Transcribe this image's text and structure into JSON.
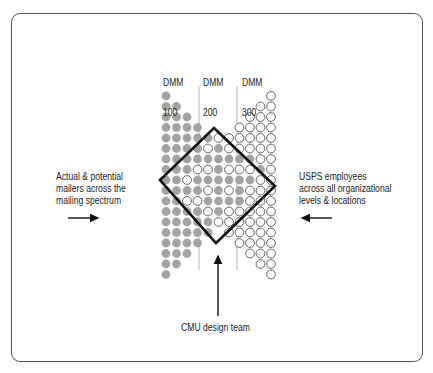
{
  "diagram": {
    "column_labels": [
      {
        "line1": "DMM",
        "line2": "100",
        "x": 163,
        "y": 58
      },
      {
        "line1": "DMM",
        "line2": "200",
        "x": 203,
        "y": 58
      },
      {
        "line1": "DMM",
        "line2": "300",
        "x": 242,
        "y": 58
      }
    ],
    "left_label": "Actual & potential\nmailers across the\nmailing spectrum",
    "right_label": "USPS employees\nacross all organizational\nlevels & locations",
    "bottom_label": "CMU design team",
    "colors": {
      "filled_circle": "#a3a3a3",
      "outline_circle": "#555555",
      "diamond": "#111111",
      "divider": "#bbbbbb",
      "frame": "#555555",
      "text": "#222222"
    },
    "grid": {
      "x0": 166,
      "y0": 96,
      "pitch": 10.5,
      "radius": 4.4,
      "columns": [
        {
          "top": 0,
          "bottom": 17,
          "pattern": "FFFFFFFFFFFFFFFFFF"
        },
        {
          "top": 1,
          "bottom": 16,
          "pattern": "FFFFFFFFFFFFFFFF"
        },
        {
          "top": 2,
          "bottom": 15,
          "pattern": "FFFFFFOFOFFFFF"
        },
        {
          "top": 3,
          "bottom": 14,
          "pattern": "FFFFOFFOFFFF"
        },
        {
          "top": 4,
          "bottom": 13,
          "pattern": "FOFOFOFOFF"
        },
        {
          "top": 4,
          "bottom": 12,
          "pattern": "OFFFFFFFO"
        },
        {
          "top": 4,
          "bottom": 13,
          "pattern": "OOFOFOFOOO"
        },
        {
          "top": 3,
          "bottom": 14,
          "pattern": "OOOFOFFFOOOO"
        },
        {
          "top": 2,
          "bottom": 15,
          "pattern": "OOOOFOFOOOOOOO"
        },
        {
          "top": 1,
          "bottom": 16,
          "pattern": "OOOOOOFOOOOOOOOO"
        },
        {
          "top": 0,
          "bottom": 17,
          "pattern": "OOOOOOOOOOOOOOOOOO"
        }
      ]
    },
    "diamond": {
      "top": [
        214,
        128
      ],
      "right": [
        275,
        186
      ],
      "bottom": [
        216,
        243
      ],
      "left": [
        160,
        180
      ]
    },
    "dividers": [
      {
        "x": 199,
        "y1": 86,
        "y2": 270
      },
      {
        "x": 237,
        "y1": 86,
        "y2": 270
      }
    ],
    "arrows": [
      {
        "name": "left-arrow",
        "x1": 68,
        "y1": 218,
        "x2": 98,
        "y2": 218
      },
      {
        "name": "right-arrow",
        "x1": 332,
        "y1": 218,
        "x2": 302,
        "y2": 218
      },
      {
        "name": "up-arrow",
        "x1": 218,
        "y1": 316,
        "x2": 218,
        "y2": 256
      }
    ]
  }
}
